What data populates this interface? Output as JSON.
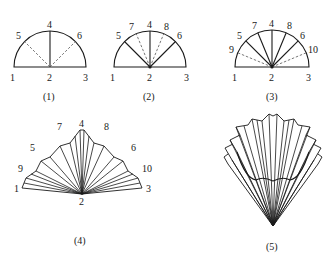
{
  "figures": [
    {
      "id": "fig1",
      "caption": "(1)",
      "description": "Semicircle with center 2; points 1 and 3 at ends of diameter; 4 at top; dashed fold lines from 2 to 5 and 6",
      "labels": {
        "p1": "1",
        "p2": "2",
        "p3": "3",
        "p4": "4",
        "p5": "5",
        "p6": "6"
      }
    },
    {
      "id": "fig2",
      "caption": "(2)",
      "description": "Semicircle with solid lines 2-5, 2-4, 2-6 and dashed fold lines 2-7, 2-8",
      "labels": {
        "p1": "1",
        "p2": "2",
        "p3": "3",
        "p4": "4",
        "p5": "5",
        "p6": "6",
        "p7": "7",
        "p8": "8"
      }
    },
    {
      "id": "fig3",
      "caption": "(3)",
      "description": "Semicircle with solid lines 2-5, 2-7, 2-4, 2-8, 2-6 and dashed fold lines 2-9, 2-10",
      "labels": {
        "p1": "1",
        "p2": "2",
        "p3": "3",
        "p4": "4",
        "p5": "5",
        "p6": "6",
        "p7": "7",
        "p8": "8",
        "p9": "9",
        "p10": "10"
      }
    },
    {
      "id": "fig4",
      "caption": "(4)",
      "description": "Pleated fan folded from semicircle, apex at 2",
      "labels": {
        "p1": "1",
        "p2": "2",
        "p3": "3",
        "p4": "4",
        "p5": "5",
        "p6": "6",
        "p7": "7",
        "p8": "8",
        "p9": "9",
        "p10": "10"
      }
    },
    {
      "id": "fig5",
      "caption": "(5)",
      "description": "Fan folded into layered pleated shape (paper fan / flower)",
      "labels": {}
    }
  ]
}
